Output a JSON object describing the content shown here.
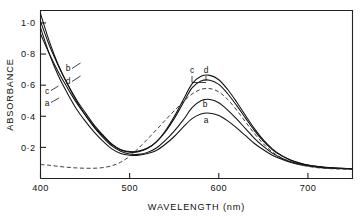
{
  "chart_data": {
    "type": "line",
    "title": "",
    "xlabel": "WAVELENGTH (nm)",
    "ylabel": "ABSORBANCE",
    "xlim": [
      400,
      750
    ],
    "ylim": [
      0.0,
      1.08
    ],
    "grid": false,
    "legend_position": "inline-curve-labels",
    "xticks": [
      400,
      500,
      600,
      700
    ],
    "xtick_labels": [
      "400",
      "500",
      "600",
      "700"
    ],
    "yticks": [
      0.2,
      0.4,
      0.6,
      0.8,
      1.0
    ],
    "ytick_labels": [
      "0·2",
      "0·4",
      "0·6",
      "0·8",
      "1·0"
    ],
    "x": [
      400,
      410,
      420,
      430,
      440,
      450,
      460,
      470,
      480,
      490,
      500,
      510,
      520,
      530,
      540,
      550,
      560,
      570,
      580,
      590,
      600,
      610,
      620,
      630,
      640,
      650,
      660,
      670,
      680,
      690,
      700,
      710,
      720,
      730,
      740,
      750
    ],
    "series": [
      {
        "name": "a",
        "style": "solid",
        "peak_wavelength": 583,
        "peak_absorbance": 0.42,
        "min_absorbance": 0.15,
        "values": [
          0.97,
          0.8,
          0.66,
          0.55,
          0.45,
          0.37,
          0.3,
          0.24,
          0.19,
          0.16,
          0.15,
          0.15,
          0.16,
          0.18,
          0.22,
          0.27,
          0.33,
          0.385,
          0.415,
          0.42,
          0.405,
          0.37,
          0.325,
          0.275,
          0.225,
          0.185,
          0.15,
          0.125,
          0.105,
          0.09,
          0.08,
          0.073,
          0.068,
          0.065,
          0.063,
          0.062
        ]
      },
      {
        "name": "b",
        "style": "solid",
        "peak_wavelength": 583,
        "peak_absorbance": 0.51,
        "min_absorbance": 0.155,
        "values": [
          1.06,
          0.88,
          0.73,
          0.61,
          0.5,
          0.41,
          0.33,
          0.265,
          0.21,
          0.175,
          0.157,
          0.155,
          0.168,
          0.196,
          0.245,
          0.305,
          0.375,
          0.455,
          0.5,
          0.508,
          0.487,
          0.44,
          0.383,
          0.32,
          0.258,
          0.206,
          0.163,
          0.132,
          0.11,
          0.094,
          0.083,
          0.075,
          0.07,
          0.066,
          0.064,
          0.063
        ]
      },
      {
        "name": "c",
        "style": "solid",
        "peak_wavelength": 583,
        "peak_absorbance": 0.632,
        "min_absorbance": 0.172,
        "values": [
          0.93,
          0.8,
          0.685,
          0.585,
          0.49,
          0.41,
          0.335,
          0.272,
          0.218,
          0.185,
          0.173,
          0.176,
          0.196,
          0.236,
          0.3,
          0.385,
          0.485,
          0.583,
          0.627,
          0.632,
          0.605,
          0.545,
          0.47,
          0.388,
          0.308,
          0.24,
          0.186,
          0.147,
          0.119,
          0.1,
          0.086,
          0.077,
          0.071,
          0.067,
          0.064,
          0.063
        ]
      },
      {
        "name": "d",
        "style": "solid",
        "peak_wavelength": 583,
        "peak_absorbance": 0.663,
        "min_absorbance": 0.168,
        "values": [
          1.01,
          0.855,
          0.725,
          0.61,
          0.51,
          0.425,
          0.345,
          0.28,
          0.222,
          0.185,
          0.169,
          0.172,
          0.192,
          0.235,
          0.305,
          0.398,
          0.505,
          0.608,
          0.657,
          0.663,
          0.635,
          0.572,
          0.492,
          0.405,
          0.321,
          0.248,
          0.191,
          0.15,
          0.121,
          0.101,
          0.087,
          0.078,
          0.072,
          0.068,
          0.065,
          0.063
        ]
      },
      {
        "name": "reference",
        "style": "dashed",
        "peak_wavelength": 585,
        "peak_absorbance": 0.578,
        "min_absorbance": 0.063,
        "values": [
          0.09,
          0.085,
          0.078,
          0.072,
          0.068,
          0.066,
          0.066,
          0.07,
          0.082,
          0.105,
          0.143,
          0.195,
          0.253,
          0.313,
          0.375,
          0.435,
          0.492,
          0.543,
          0.573,
          0.578,
          0.557,
          0.508,
          0.44,
          0.364,
          0.289,
          0.223,
          0.171,
          0.134,
          0.108,
          0.09,
          0.078,
          0.07,
          0.065,
          0.062,
          0.06,
          0.059
        ]
      }
    ],
    "annotations": [
      {
        "text": "b",
        "x_px": 68,
        "y_px": 71,
        "anchor": "left-upper"
      },
      {
        "text": "d",
        "x_px": 68,
        "y_px": 84,
        "anchor": "left-upper"
      },
      {
        "text": "c",
        "x_px": 47,
        "y_px": 94,
        "anchor": "left-lower"
      },
      {
        "text": "a",
        "x_px": 47,
        "y_px": 106,
        "anchor": "left-lower"
      },
      {
        "text": "c",
        "x_px": 192,
        "y_px": 73,
        "anchor": "peak"
      },
      {
        "text": "d",
        "x_px": 206,
        "y_px": 73,
        "anchor": "peak"
      },
      {
        "text": "b",
        "x_px": 205,
        "y_px": 107,
        "anchor": "peak"
      },
      {
        "text": "a",
        "x_px": 206,
        "y_px": 123,
        "anchor": "peak"
      }
    ]
  }
}
